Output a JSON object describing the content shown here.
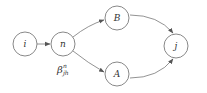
{
  "diagram": {
    "nodes": [
      {
        "id": "i",
        "label": "i",
        "cx": 25,
        "cy": 44
      },
      {
        "id": "n",
        "label": "n",
        "cx": 63,
        "cy": 44
      },
      {
        "id": "B",
        "label": "B",
        "cx": 117,
        "cy": 18
      },
      {
        "id": "A",
        "label": "A",
        "cx": 117,
        "cy": 74
      },
      {
        "id": "j",
        "label": "j",
        "cx": 176,
        "cy": 46
      }
    ],
    "edges": [
      {
        "from": "i",
        "to": "n"
      },
      {
        "from": "n",
        "to": "B"
      },
      {
        "from": "n",
        "to": "A"
      },
      {
        "from": "B",
        "to": "j"
      },
      {
        "from": "A",
        "to": "j"
      }
    ],
    "edge_label": {
      "base": "β",
      "sup": "n",
      "sub": "jh"
    }
  }
}
